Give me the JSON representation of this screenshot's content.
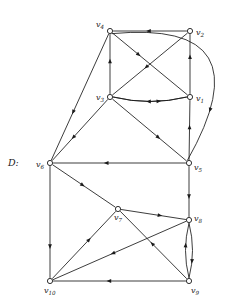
{
  "figure": {
    "label": "D:",
    "caption": "",
    "background_color": "#ffffff",
    "ink_color": "#1a1a1a"
  },
  "chart_data": {
    "type": "diagram",
    "subtype": "directed-graph",
    "title": "D:",
    "xlabel": "",
    "ylabel": "",
    "grid": false,
    "legend": "none",
    "nodes": [
      {
        "id": "v1",
        "label": "v",
        "subscript": "1",
        "x": 190,
        "y": 97,
        "label_dx": 6,
        "label_dy": 3.5
      },
      {
        "id": "v2",
        "label": "v",
        "subscript": "2",
        "x": 190,
        "y": 31,
        "label_dx": 6,
        "label_dy": 3.5
      },
      {
        "id": "v3",
        "label": "v",
        "subscript": "3",
        "x": 110,
        "y": 97,
        "label_dx": -14,
        "label_dy": 2.5
      },
      {
        "id": "v4",
        "label": "v",
        "subscript": "4",
        "x": 110,
        "y": 31,
        "label_dx": -14,
        "label_dy": -4
      },
      {
        "id": "v5",
        "label": "v",
        "subscript": "5",
        "x": 189,
        "y": 163,
        "label_dx": 5,
        "label_dy": 7
      },
      {
        "id": "v6",
        "label": "v",
        "subscript": "6",
        "x": 50,
        "y": 163,
        "label_dx": -14,
        "label_dy": 3.5
      },
      {
        "id": "v7",
        "label": "v",
        "subscript": "7",
        "x": 118,
        "y": 209,
        "label_dx": -4,
        "label_dy": 11
      },
      {
        "id": "v8",
        "label": "v",
        "subscript": "8",
        "x": 189,
        "y": 220,
        "label_dx": 5,
        "label_dy": 1
      },
      {
        "id": "v9",
        "label": "v",
        "subscript": "9",
        "x": 189,
        "y": 281,
        "label_dx": 2,
        "label_dy": 12
      },
      {
        "id": "v10",
        "label": "v",
        "subscript": "10",
        "x": 50,
        "y": 281,
        "label_dx": -6,
        "label_dy": 12
      }
    ],
    "edges": [
      {
        "from": "v2",
        "to": "v4",
        "style": "straight",
        "arrow_t": 0.52
      },
      {
        "from": "v2",
        "to": "v3",
        "style": "straight",
        "arrow_t": 0.55
      },
      {
        "from": "v4",
        "to": "v1",
        "style": "straight",
        "arrow_t": 0.35
      },
      {
        "from": "v3",
        "to": "v4",
        "style": "straight",
        "arrow_t": 0.55
      },
      {
        "from": "v1",
        "to": "v2",
        "style": "straight",
        "arrow_t": 0.62
      },
      {
        "from": "v1",
        "to": "v3",
        "style": "curve-up",
        "arrow_t": 0.52,
        "bow": -9
      },
      {
        "from": "v3",
        "to": "v1",
        "style": "curve-down",
        "arrow_t": 0.62,
        "bow": 9
      },
      {
        "from": "v4",
        "to": "v6",
        "style": "straight",
        "arrow_t": 0.62
      },
      {
        "from": "v3",
        "to": "v6",
        "style": "straight",
        "arrow_t": 0.62
      },
      {
        "from": "v3",
        "to": "v5",
        "style": "straight",
        "arrow_t": 0.62
      },
      {
        "from": "v5",
        "to": "v1",
        "style": "straight",
        "arrow_t": 0.55
      },
      {
        "from": "v4",
        "to": "v5",
        "style": "big-arc",
        "arrow_t": 0.8,
        "bow": -62
      },
      {
        "from": "v5",
        "to": "v6",
        "style": "straight",
        "arrow_t": 0.6
      },
      {
        "from": "v5",
        "to": "v8",
        "style": "straight",
        "arrow_t": 0.6
      },
      {
        "from": "v6",
        "to": "v7",
        "style": "straight",
        "arrow_t": 0.48
      },
      {
        "from": "v6",
        "to": "v10",
        "style": "straight",
        "arrow_t": 0.72
      },
      {
        "from": "v7",
        "to": "v8",
        "style": "straight",
        "arrow_t": 0.6
      },
      {
        "from": "v10",
        "to": "v7",
        "style": "straight",
        "arrow_t": 0.58
      },
      {
        "from": "v8",
        "to": "v10",
        "style": "straight",
        "arrow_t": 0.55
      },
      {
        "from": "v9",
        "to": "v7",
        "style": "straight",
        "arrow_t": 0.52
      },
      {
        "from": "v9",
        "to": "v10",
        "style": "straight",
        "arrow_t": 0.58
      },
      {
        "from": "v8",
        "to": "v9",
        "style": "curve-left",
        "arrow_t": 0.7,
        "bow": -7
      },
      {
        "from": "v9",
        "to": "v8",
        "style": "curve-right",
        "arrow_t": 0.6,
        "bow": -7
      }
    ]
  }
}
